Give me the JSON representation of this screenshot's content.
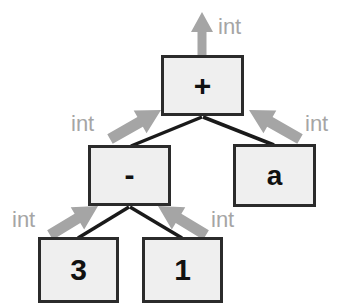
{
  "diagram": {
    "kind": "annotated-abstract-syntax-tree",
    "colors": {
      "background": "#ffffff",
      "node_fill": "#efefef",
      "node_border": "#2b2b2b",
      "edge": "#1a1a1a",
      "annotation_gray": "#a5a5a5",
      "node_text": "#111111"
    },
    "nodes": [
      {
        "id": "root-plus",
        "label": "+",
        "x": 161,
        "y": 55,
        "w": 83,
        "h": 61,
        "label_class": "op-plus"
      },
      {
        "id": "minus",
        "label": "-",
        "x": 88,
        "y": 145,
        "w": 83,
        "h": 61,
        "label_class": "op-minus"
      },
      {
        "id": "ident-a",
        "label": "a",
        "x": 233,
        "y": 144,
        "w": 83,
        "h": 63,
        "label_class": "ident"
      },
      {
        "id": "literal-3",
        "label": "3",
        "x": 38,
        "y": 237,
        "w": 81,
        "h": 66,
        "label_class": "num"
      },
      {
        "id": "literal-1",
        "label": "1",
        "x": 142,
        "y": 237,
        "w": 81,
        "h": 66,
        "label_class": "num"
      }
    ],
    "edges": [
      {
        "id": "edge-plus-minus",
        "from": "root-plus",
        "to": "minus",
        "x1": 202,
        "y1": 117,
        "x2": 131,
        "y2": 146
      },
      {
        "id": "edge-plus-a",
        "from": "root-plus",
        "to": "ident-a",
        "x1": 203,
        "y1": 117,
        "x2": 274,
        "y2": 145
      },
      {
        "id": "edge-minus-3",
        "from": "minus",
        "to": "literal-3",
        "x1": 129,
        "y1": 207,
        "x2": 78,
        "y2": 238
      },
      {
        "id": "edge-minus-1",
        "from": "minus",
        "to": "literal-1",
        "x1": 130,
        "y1": 207,
        "x2": 182,
        "y2": 238
      }
    ],
    "annotations": [
      {
        "id": "type-root",
        "text": "int",
        "for_node": "root-plus",
        "direction": "up",
        "text_x": 218,
        "text_y": 16,
        "arrow": {
          "x1": 202,
          "y1": 55,
          "x2": 202,
          "y2": 12
        }
      },
      {
        "id": "type-minus",
        "text": "int",
        "for_node": "minus",
        "direction": "up-right",
        "text_x": 71,
        "text_y": 113,
        "arrow": {
          "x1": 110,
          "y1": 139,
          "x2": 161,
          "y2": 110
        }
      },
      {
        "id": "type-a",
        "text": "int",
        "for_node": "ident-a",
        "direction": "up-left",
        "text_x": 305,
        "text_y": 113,
        "arrow": {
          "x1": 300,
          "y1": 139,
          "x2": 249,
          "y2": 110
        }
      },
      {
        "id": "type-3",
        "text": "int",
        "for_node": "literal-3",
        "direction": "up-right",
        "text_x": 12,
        "text_y": 209,
        "arrow": {
          "x1": 50,
          "y1": 235,
          "x2": 98,
          "y2": 206
        }
      },
      {
        "id": "type-1",
        "text": "int",
        "for_node": "literal-1",
        "direction": "up-left",
        "text_x": 211,
        "text_y": 209,
        "arrow": {
          "x1": 206,
          "y1": 235,
          "x2": 158,
          "y2": 206
        }
      }
    ]
  }
}
